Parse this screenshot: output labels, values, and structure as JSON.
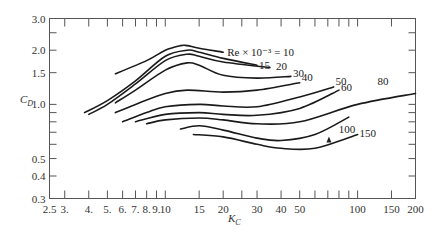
{
  "chart_data": {
    "type": "line",
    "title": "",
    "xlabel": "K_C",
    "ylabel": "C_D",
    "xscale": "log",
    "yscale": "log",
    "xlim": [
      2.5,
      200
    ],
    "ylim": [
      0.3,
      3.0
    ],
    "grid": false,
    "legend": "inline curve labels",
    "x_tick_labels": [
      "2.5",
      "3.",
      "4.",
      "5.",
      "6.",
      "7.",
      "8.",
      "9.",
      "10",
      "15",
      "20",
      "30",
      "40",
      "50",
      "100",
      "150",
      "200"
    ],
    "y_tick_labels": [
      "0.3",
      "0.4",
      "0.5",
      "1.0",
      "1.5",
      "2.0",
      "3.0"
    ],
    "annotation": "Re × 10⁻³ = 10",
    "series": [
      {
        "name": "10",
        "label": "Re × 10⁻³ = 10",
        "x": [
          5.5,
          8,
          10,
          12,
          13,
          15,
          20
        ],
        "y": [
          1.48,
          1.75,
          2.0,
          2.12,
          2.12,
          2.05,
          1.95
        ]
      },
      {
        "name": "15",
        "label": "15",
        "x": [
          3.8,
          5,
          7,
          10,
          13,
          15,
          20,
          30
        ],
        "y": [
          0.9,
          1.05,
          1.35,
          1.85,
          2.0,
          1.95,
          1.8,
          1.65
        ]
      },
      {
        "name": "20",
        "label": "20",
        "x": [
          4,
          5,
          7,
          10,
          13,
          15,
          20,
          35
        ],
        "y": [
          0.88,
          1.0,
          1.3,
          1.75,
          1.9,
          1.85,
          1.72,
          1.6
        ]
      },
      {
        "name": "30",
        "label": "30",
        "x": [
          5.5,
          7,
          10,
          13,
          15,
          20,
          30,
          45
        ],
        "y": [
          1.02,
          1.2,
          1.55,
          1.7,
          1.65,
          1.45,
          1.4,
          1.43
        ]
      },
      {
        "name": "40",
        "label": "40",
        "x": [
          5.5,
          7,
          10,
          13,
          20,
          30,
          50
        ],
        "y": [
          0.9,
          1.0,
          1.15,
          1.2,
          1.17,
          1.2,
          1.32
        ]
      },
      {
        "name": "50",
        "label": "50",
        "x": [
          6,
          8,
          10,
          15,
          20,
          30,
          50,
          75
        ],
        "y": [
          0.8,
          0.9,
          0.97,
          1.0,
          0.98,
          0.97,
          1.1,
          1.25
        ]
      },
      {
        "name": "60",
        "label": "60",
        "x": [
          7,
          10,
          15,
          20,
          30,
          50,
          80
        ],
        "y": [
          0.8,
          0.88,
          0.9,
          0.88,
          0.87,
          0.95,
          1.2
        ]
      },
      {
        "name": "80",
        "label": "80",
        "x": [
          8,
          10,
          15,
          20,
          30,
          50,
          100,
          200
        ],
        "y": [
          0.78,
          0.82,
          0.84,
          0.82,
          0.78,
          0.8,
          1.0,
          1.15
        ]
      },
      {
        "name": "100",
        "label": "100",
        "x": [
          12,
          15,
          20,
          30,
          40,
          60,
          90
        ],
        "y": [
          0.73,
          0.76,
          0.72,
          0.65,
          0.63,
          0.68,
          0.85
        ]
      },
      {
        "name": "150",
        "label": "150",
        "x": [
          14,
          20,
          30,
          40,
          60,
          100
        ],
        "y": [
          0.68,
          0.66,
          0.6,
          0.57,
          0.57,
          0.68
        ]
      }
    ]
  },
  "labels": {
    "y_axis_title": "C",
    "y_axis_sub": "D",
    "x_axis_title": "K",
    "x_axis_sub": "C"
  }
}
